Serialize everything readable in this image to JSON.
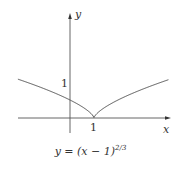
{
  "diagram": {
    "x_axis_label": "x",
    "y_axis_label": "y",
    "y_tick_label": "1",
    "x_tick_label": "1",
    "caption": {
      "lhs": "y = (x − 1)",
      "exponent": "2/3"
    },
    "colors": {
      "curve": "#555555",
      "axes": "#555555",
      "text": "#333333"
    }
  },
  "chart_data": {
    "type": "line",
    "xlabel": "x",
    "ylabel": "y",
    "x_ticks": [
      1
    ],
    "y_ticks": [
      1
    ],
    "function": "(x-1)^(2/3)",
    "x_range": [
      -2.17,
      4.1
    ],
    "cusp": [
      1,
      0
    ],
    "y_intercept": [
      0,
      1
    ],
    "grid": false,
    "legend": null
  }
}
